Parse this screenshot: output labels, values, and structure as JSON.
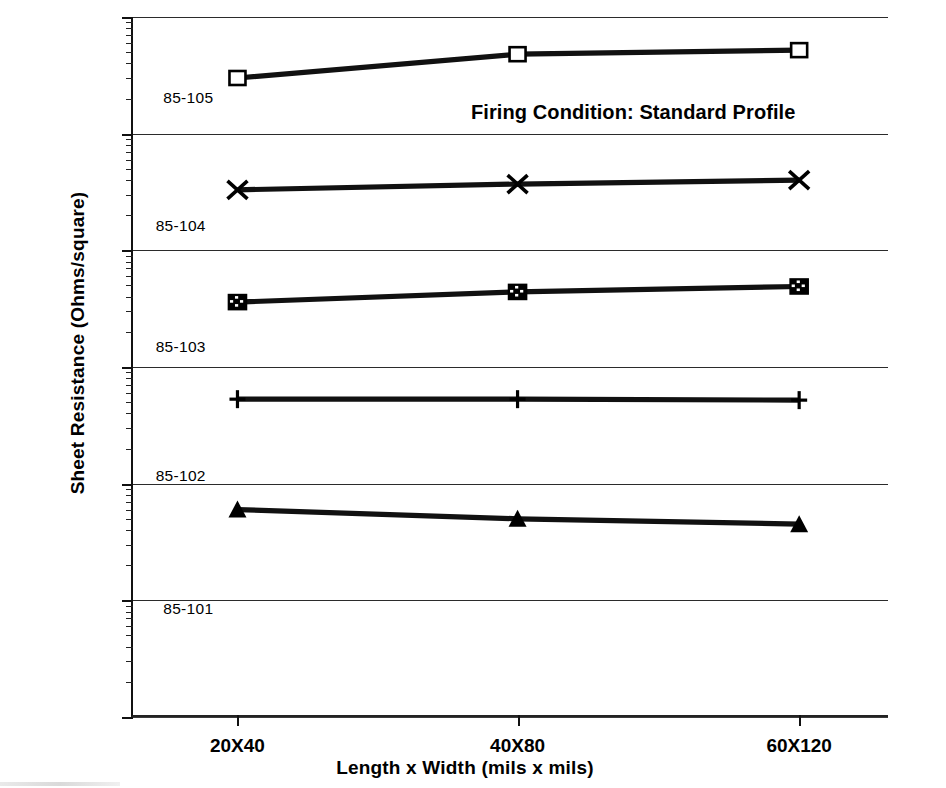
{
  "chart_data": {
    "type": "line",
    "title": "",
    "annotation": "Firing Condition: Standard Profile",
    "xlabel": "Length x Width  (mils x mils)",
    "ylabel": "Sheet Resistance  (Ohms/square)",
    "categories": [
      "20X40",
      "40X80",
      "60X120"
    ],
    "yscale": "log",
    "ylim": [
      1,
      1000000
    ],
    "ytick_labels": [
      "1E6",
      "1E5",
      "1E4",
      "1000",
      "100",
      "10",
      "1"
    ],
    "ytick_values": [
      1000000,
      100000,
      10000,
      1000,
      100,
      10,
      1
    ],
    "grid": true,
    "legend_position": "inline-left",
    "series": [
      {
        "name": "85-105",
        "marker": "open-square",
        "values": [
          300000,
          480000,
          520000
        ]
      },
      {
        "name": "85-104",
        "marker": "cross-x",
        "values": [
          33000,
          37000,
          40000
        ]
      },
      {
        "name": "85-103",
        "marker": "hatched-square",
        "values": [
          3600,
          4400,
          4900
        ]
      },
      {
        "name": "85-102",
        "marker": "plus",
        "values": [
          530,
          530,
          520
        ]
      },
      {
        "name": "85-101",
        "marker": "filled-triangle",
        "values": [
          60,
          50,
          45
        ]
      }
    ]
  },
  "series_labels": [
    {
      "text": "85-105",
      "x": 0.04,
      "yvalue": 200000
    },
    {
      "text": "85-104",
      "x": 0.03,
      "yvalue": 16000
    },
    {
      "text": "85-103",
      "x": 0.03,
      "yvalue": 1450
    },
    {
      "text": "85-102",
      "x": 0.03,
      "yvalue": 115
    },
    {
      "text": "85-101",
      "x": 0.04,
      "yvalue": 8.3
    }
  ],
  "colors": {
    "ink": "#000000",
    "line": "#111111",
    "grid": "#2b2b2b",
    "background": "#ffffff"
  }
}
